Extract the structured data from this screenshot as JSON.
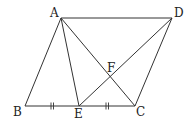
{
  "figure": {
    "stroke_color": "#333333",
    "label_color": "#222222",
    "points": {
      "A": {
        "label": "A",
        "x": 61,
        "y": 18,
        "label_x": 50,
        "label_y": 17
      },
      "B": {
        "label": "B",
        "x": 25,
        "y": 106,
        "label_x": 13,
        "label_y": 116
      },
      "C": {
        "label": "C",
        "x": 135,
        "y": 106,
        "label_x": 136,
        "label_y": 116
      },
      "D": {
        "label": "D",
        "x": 172,
        "y": 18,
        "label_x": 174,
        "label_y": 17
      },
      "E": {
        "label": "E",
        "x": 79,
        "y": 106,
        "label_x": 74,
        "label_y": 118
      },
      "F": {
        "label": "F",
        "x": 110,
        "y": 77,
        "label_x": 107,
        "label_y": 72
      }
    },
    "segments": [
      {
        "name": "segment-ab",
        "from": "A",
        "to": "B"
      },
      {
        "name": "segment-ad",
        "from": "A",
        "to": "D"
      },
      {
        "name": "segment-bc",
        "from": "B",
        "to": "C"
      },
      {
        "name": "segment-cd",
        "from": "C",
        "to": "D"
      },
      {
        "name": "segment-ae",
        "from": "A",
        "to": "E"
      },
      {
        "name": "segment-ac",
        "from": "A",
        "to": "C"
      },
      {
        "name": "segment-ed",
        "from": "E",
        "to": "D"
      }
    ],
    "equal_marks": [
      {
        "segment": "BE",
        "mark": "double-tick",
        "x": 52,
        "y": 106
      },
      {
        "segment": "EC",
        "mark": "double-tick",
        "x": 107,
        "y": 106
      }
    ]
  }
}
